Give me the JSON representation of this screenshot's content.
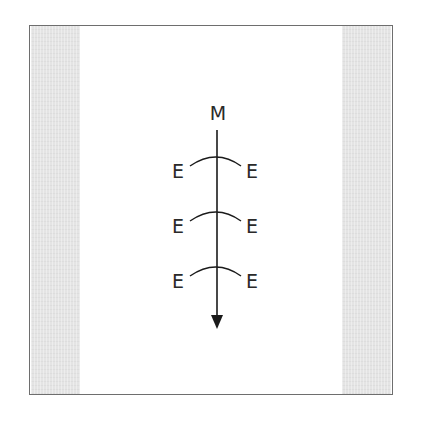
{
  "diagram": {
    "top_label": "M",
    "arrow": {
      "direction": "down",
      "x": 217,
      "y_start": 130,
      "y_end": 328
    },
    "rungs": [
      {
        "left_label": "E",
        "right_label": "E",
        "y": 157
      },
      {
        "left_label": "E",
        "right_label": "E",
        "y": 212
      },
      {
        "left_label": "E",
        "right_label": "E",
        "y": 267
      }
    ],
    "colors": {
      "line": "#1a1a1a",
      "frame_border": "#6e6e6e",
      "side_strip": "#e4e4e4",
      "background": "#ffffff"
    }
  }
}
